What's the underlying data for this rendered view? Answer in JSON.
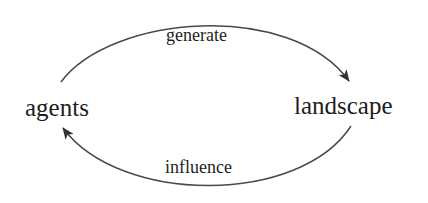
{
  "diagram": {
    "type": "cycle",
    "nodes": [
      {
        "id": "agents",
        "label": "agents"
      },
      {
        "id": "landscape",
        "label": "landscape"
      }
    ],
    "edges": [
      {
        "from": "agents",
        "to": "landscape",
        "label": "generate",
        "position": "top"
      },
      {
        "from": "landscape",
        "to": "agents",
        "label": "influence",
        "position": "bottom"
      }
    ],
    "colors": {
      "stroke": "#444444",
      "text": "#1e1e1e",
      "background": "#ffffff"
    }
  }
}
